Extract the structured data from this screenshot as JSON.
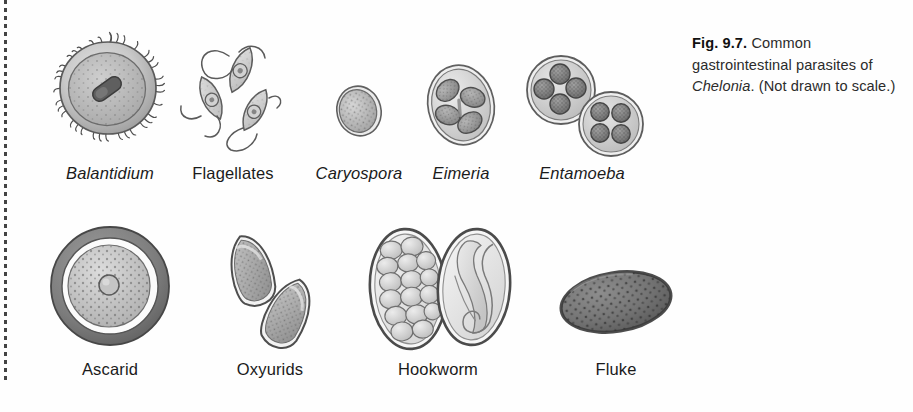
{
  "figure": {
    "number": "Fig. 9.7.",
    "caption_part1": " Common gastrointestinal parasites of ",
    "caption_italic": "Chelonia",
    "caption_part2": ". (Not drawn to scale.)"
  },
  "colors": {
    "ink": "#3a3a3a",
    "outline": "#4a4a4a",
    "fill_light": "#d8d8d8",
    "fill_mid": "#b5b5b5",
    "fill_dark": "#8a8a8a",
    "fill_darkest": "#6a6a6a",
    "page": "#fefefe",
    "text": "#1b1b1b"
  },
  "rows": [
    {
      "name": "protozoa-row",
      "specimens": [
        {
          "id": "balantidium",
          "label": "Balantidium",
          "italic": true,
          "icon": "balantidium-ciliate-icon"
        },
        {
          "id": "flagellates",
          "label": "Flagellates",
          "italic": false,
          "icon": "flagellates-icon"
        },
        {
          "id": "caryospora",
          "label": "Caryospora",
          "italic": true,
          "icon": "caryospora-oocyst-icon"
        },
        {
          "id": "eimeria",
          "label": "Eimeria",
          "italic": true,
          "icon": "eimeria-oocyst-icon"
        },
        {
          "id": "entamoeba",
          "label": "Entamoeba",
          "italic": true,
          "icon": "entamoeba-cyst-icon"
        }
      ]
    },
    {
      "name": "helminth-row",
      "specimens": [
        {
          "id": "ascarid",
          "label": "Ascarid",
          "italic": false,
          "icon": "ascarid-egg-icon"
        },
        {
          "id": "oxyurids",
          "label": "Oxyurids",
          "italic": false,
          "icon": "oxyurid-eggs-icon"
        },
        {
          "id": "hookworm",
          "label": "Hookworm",
          "italic": false,
          "icon": "hookworm-eggs-icon"
        },
        {
          "id": "fluke",
          "label": "Fluke",
          "italic": false,
          "icon": "fluke-egg-icon"
        }
      ]
    }
  ]
}
